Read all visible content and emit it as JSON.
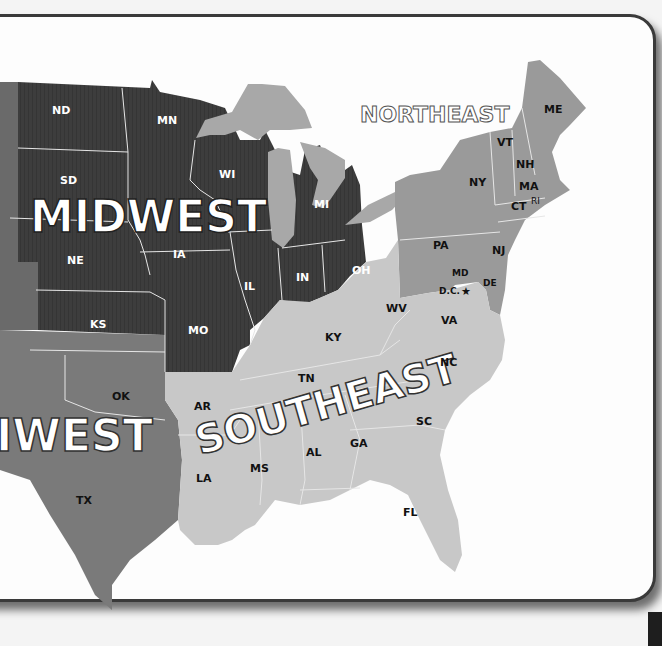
{
  "map": {
    "colors": {
      "midwest": "#3d3d3d",
      "northeast": "#9a9a9a",
      "southeast": "#c8c8c8",
      "southwest": "#7a7a7a",
      "west": "#6a6a6a",
      "lakes": "#a8a8a8",
      "ocean": "#fdfdfd"
    },
    "regions": {
      "midwest": "MIDWEST",
      "northeast": "NORTHEAST",
      "southeast": "SOUTHEAST",
      "southwest": "IWEST"
    },
    "states": {
      "ND": "ND",
      "MN": "MN",
      "SD": "SD",
      "WI": "WI",
      "MI": "MI",
      "NE": "NE",
      "IA": "IA",
      "IL": "IL",
      "IN": "IN",
      "OH": "OH",
      "KS": "KS",
      "MO": "MO",
      "ME": "ME",
      "VT": "VT",
      "NH": "NH",
      "NY": "NY",
      "MA": "MA",
      "CT": "CT",
      "RI": "RI",
      "PA": "PA",
      "NJ": "NJ",
      "MD": "MD",
      "DE": "DE",
      "DC": "D.C.",
      "WV": "WV",
      "VA": "VA",
      "KY": "KY",
      "TN": "TN",
      "NC": "NC",
      "SC": "SC",
      "AR": "AR",
      "GA": "GA",
      "AL": "AL",
      "MS": "MS",
      "LA": "LA",
      "FL": "FL",
      "OK": "OK",
      "TX": "TX"
    }
  }
}
